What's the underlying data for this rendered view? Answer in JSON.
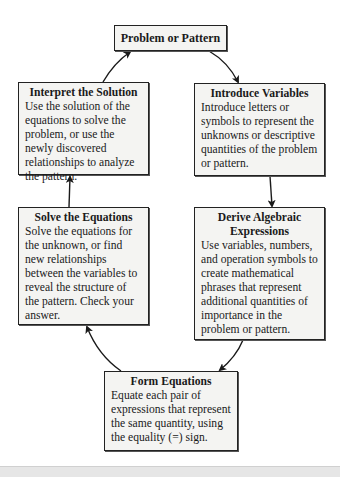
{
  "diagram": {
    "type": "cycle-flowchart",
    "start": {
      "title": "Problem or Pattern"
    },
    "steps": [
      {
        "id": "introduce",
        "title": "Introduce Variables",
        "description": "Introduce letters or symbols to represent the unknowns or descriptive quantities of the problem or pattern."
      },
      {
        "id": "derive",
        "title": "Derive Algebraic Expressions",
        "description": "Use variables, numbers, and operation symbols to create mathematical phrases that represent additional quantities of importance in the problem or pattern."
      },
      {
        "id": "form",
        "title": "Form Equations",
        "description": "Equate each pair of expressions that represent the same quantity, using the equality (=) sign."
      },
      {
        "id": "solve",
        "title": "Solve the Equations",
        "description": "Solve the equations for the unknown, or find new relationships between the variables to reveal the structure of the pattern. Check your answer."
      },
      {
        "id": "interpret",
        "title": "Interpret the Solution",
        "description": "Use the solution of the equations to solve the problem, or use the newly discovered relationships to analyze the pattern."
      }
    ],
    "edges": [
      [
        "Problem or Pattern",
        "Introduce Variables"
      ],
      [
        "Introduce Variables",
        "Derive Algebraic Expressions"
      ],
      [
        "Derive Algebraic Expressions",
        "Form Equations"
      ],
      [
        "Form Equations",
        "Solve the Equations"
      ],
      [
        "Solve the Equations",
        "Interpret the Solution"
      ],
      [
        "Interpret the Solution",
        "Problem or Pattern"
      ]
    ]
  },
  "colors": {
    "box_fill": "#f4f4f2",
    "box_border": "#222222",
    "arrow": "#1a1a1a"
  }
}
